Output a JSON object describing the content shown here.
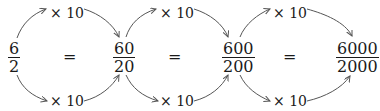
{
  "fractions": [
    {
      "numerator": "6",
      "denominator": "2"
    },
    {
      "numerator": "60",
      "denominator": "20"
    },
    {
      "numerator": "600",
      "denominator": "200"
    },
    {
      "numerator": "6000",
      "denominator": "2000"
    }
  ],
  "equals": [
    "=",
    "=",
    "="
  ],
  "top_labels": [
    "× 10",
    "× 10",
    "× 10"
  ],
  "bottom_labels": [
    "× 10",
    "× 10",
    "× 10"
  ],
  "arrow_color": "#555555"
}
